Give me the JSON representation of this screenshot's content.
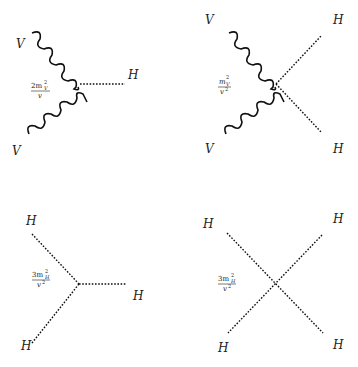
{
  "diagrams": [
    {
      "id": "VVH",
      "labels": {
        "top_left": "V",
        "bottom_left": "V",
        "right": "H"
      },
      "coupling": {
        "numerator": "2m",
        "sup": "2",
        "sub": "V",
        "denominator": "v"
      }
    },
    {
      "id": "VVHH",
      "labels": {
        "top_left": "V",
        "bottom_left": "V",
        "top_right": "H",
        "bottom_right": "H"
      },
      "coupling": {
        "numerator": "m",
        "sup": "2",
        "sub": "V",
        "denominator": "v",
        "den_sup": "2"
      }
    },
    {
      "id": "HHH",
      "labels": {
        "top_left": "H",
        "bottom_left": "H",
        "right": "H"
      },
      "coupling": {
        "numerator": "3m",
        "sup": "2",
        "sub": "H",
        "denominator": "v",
        "den_sup": "2"
      }
    },
    {
      "id": "HHHH",
      "labels": {
        "top_left": "H",
        "bottom_left": "H",
        "top_right": "H",
        "bottom_right": "H"
      },
      "coupling": {
        "numerator": "3m",
        "sup": "2",
        "sub": "H",
        "denominator": "v",
        "den_sup": "2"
      }
    }
  ],
  "colors": {
    "line": "#111111",
    "background": "#ffffff"
  }
}
